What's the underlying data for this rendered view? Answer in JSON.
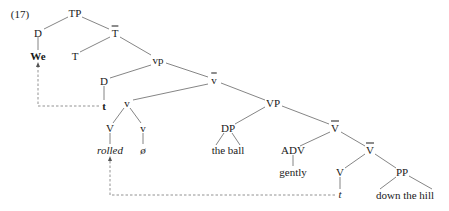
{
  "example_number": "(17)",
  "nodes": {
    "tp": "TP",
    "d_subj": "D",
    "t_bar": "T",
    "we": "We",
    "t_head": "T",
    "vp_small": "vp",
    "d_trace": "D",
    "t_trace_bold": "t",
    "v_bar": "v",
    "v_head": "v",
    "vp_big": "VP",
    "V_head": "V",
    "v_head2": "v",
    "rolled": "rolled",
    "null": "ø",
    "dp": "DP",
    "V_bar1": "V",
    "the_ball": "the ball",
    "adv": "ADV",
    "V_bar2": "V",
    "gently": "gently",
    "V_low": "V",
    "pp": "PP",
    "t_trace_italic": "t",
    "down_the_hill": "down the hill"
  },
  "colors": {
    "line": "#555555",
    "text": "#1a1a1a"
  }
}
